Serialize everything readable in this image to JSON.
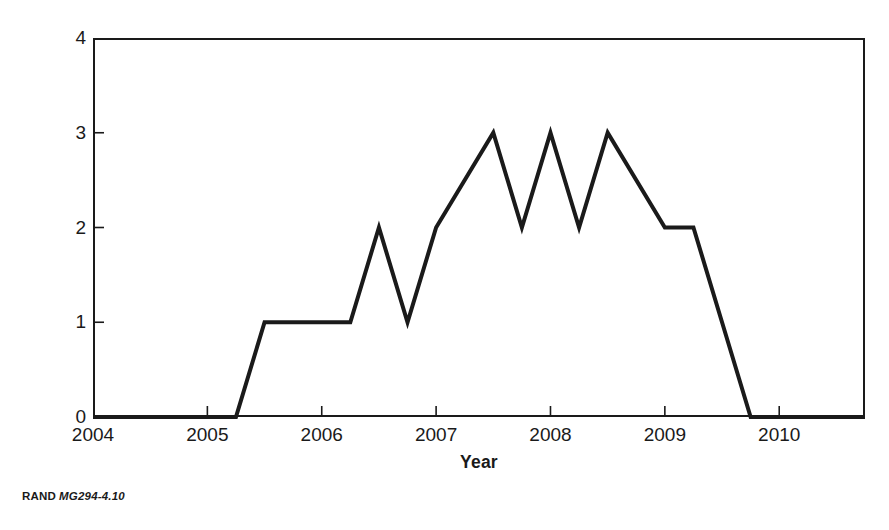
{
  "figure": {
    "credit_org": "RAND",
    "credit_doc_id": "MG294-4.10",
    "background_color": "#ffffff",
    "ink_color": "#1a1a1a"
  },
  "chart_data": {
    "type": "line",
    "title": "",
    "subtitle": "",
    "xlabel": "Year",
    "ylabel": "Required capacity",
    "xlim": [
      2004,
      2010.75
    ],
    "ylim": [
      0,
      4
    ],
    "xticks": [
      2004,
      2005,
      2006,
      2007,
      2008,
      2009,
      2010
    ],
    "xtick_labels": [
      "2004",
      "2005",
      "2006",
      "2007",
      "2008",
      "2009",
      "2010"
    ],
    "yticks": [
      0,
      1,
      2,
      3,
      4
    ],
    "ytick_labels": [
      "0",
      "1",
      "2",
      "3",
      "4"
    ],
    "grid": false,
    "legend": false,
    "legend_position": "none",
    "line_color": "#1a1a1a",
    "line_width": 4,
    "series": [
      {
        "name": "Required capacity",
        "x": [
          2004.0,
          2005.25,
          2005.5,
          2006.25,
          2006.5,
          2006.75,
          2007.0,
          2007.5,
          2007.75,
          2008.0,
          2008.25,
          2008.5,
          2009.0,
          2009.25,
          2009.5,
          2009.75,
          2010.75
        ],
        "values": [
          0,
          0,
          1,
          1,
          2,
          1,
          2,
          3,
          2,
          3,
          2,
          3,
          2,
          2,
          1,
          0,
          0
        ]
      }
    ],
    "annotations": []
  }
}
